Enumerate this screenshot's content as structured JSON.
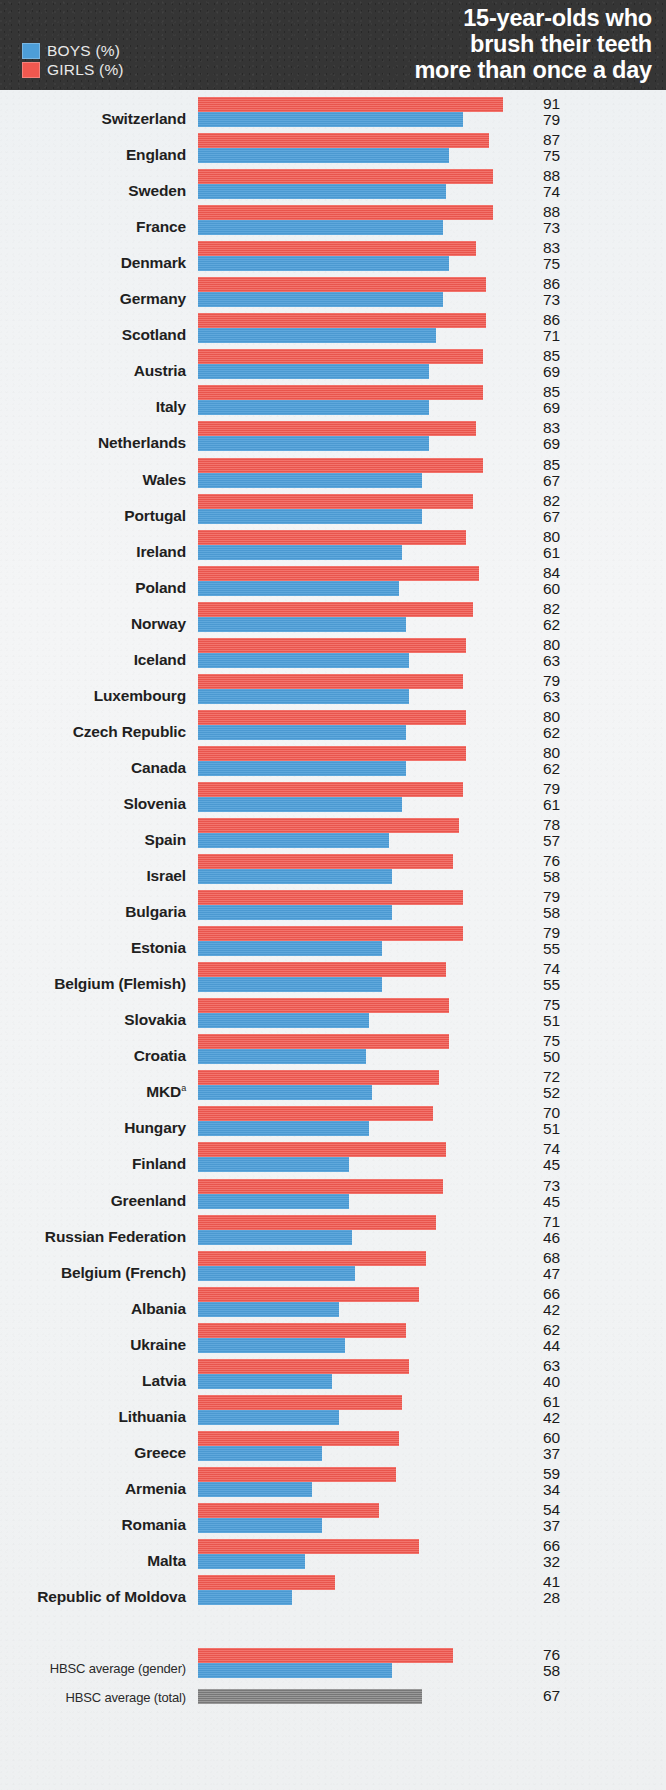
{
  "header": {
    "title_lines": [
      "15-year-olds who",
      "brush their teeth",
      "more than once a day"
    ],
    "legend": [
      {
        "label": "BOYS (%)",
        "color": "#4d9ed8",
        "key": "boys"
      },
      {
        "label": "GIRLS (%)",
        "color": "#f0584f",
        "key": "girls"
      }
    ],
    "background_color": "#353535"
  },
  "chart_data": {
    "type": "bar",
    "orientation": "horizontal",
    "title": "15-year-olds who brush their teeth more than once a day",
    "xlabel": "",
    "ylabel": "",
    "xlim": [
      0,
      100
    ],
    "grid": false,
    "legend_position": "top-left",
    "sorted_by": "boys descending",
    "categories": [
      "Switzerland",
      "England",
      "Sweden",
      "France",
      "Denmark",
      "Germany",
      "Scotland",
      "Austria",
      "Italy",
      "Netherlands",
      "Wales",
      "Portugal",
      "Ireland",
      "Poland",
      "Norway",
      "Iceland",
      "Luxembourg",
      "Czech Republic",
      "Canada",
      "Slovenia",
      "Spain",
      "Israel",
      "Bulgaria",
      "Estonia",
      "Belgium (Flemish)",
      "Slovakia",
      "Croatia",
      "MKD",
      "Hungary",
      "Finland",
      "Greenland",
      "Russian Federation",
      "Belgium (French)",
      "Albania",
      "Ukraine",
      "Latvia",
      "Lithuania",
      "Greece",
      "Armenia",
      "Romania",
      "Malta",
      "Republic of Moldova"
    ],
    "series": [
      {
        "name": "GIRLS (%)",
        "color": "#f0584f",
        "values": [
          91,
          87,
          88,
          88,
          83,
          86,
          86,
          85,
          85,
          83,
          85,
          82,
          80,
          84,
          82,
          80,
          79,
          80,
          80,
          79,
          78,
          76,
          79,
          79,
          74,
          75,
          75,
          72,
          70,
          74,
          73,
          71,
          68,
          66,
          62,
          63,
          61,
          60,
          59,
          54,
          66,
          41
        ]
      },
      {
        "name": "BOYS (%)",
        "color": "#4d9ed8",
        "values": [
          79,
          75,
          74,
          73,
          75,
          73,
          71,
          69,
          69,
          69,
          67,
          67,
          61,
          60,
          62,
          63,
          63,
          62,
          62,
          61,
          57,
          58,
          58,
          55,
          55,
          51,
          50,
          52,
          51,
          45,
          45,
          46,
          47,
          42,
          44,
          40,
          42,
          37,
          34,
          37,
          32,
          28
        ]
      }
    ],
    "averages": [
      {
        "label": "HBSC average (gender)",
        "girls": 76,
        "boys": 58
      },
      {
        "label": "HBSC average (total)",
        "total": 67,
        "color": "#7d7d7d"
      }
    ],
    "footnotes": [
      {
        "marker": "a",
        "applies_to": "MKD"
      }
    ]
  },
  "rows": [
    {
      "label": "Switzerland",
      "sup": "",
      "girls": 91,
      "boys": 79
    },
    {
      "label": "England",
      "sup": "",
      "girls": 87,
      "boys": 75
    },
    {
      "label": "Sweden",
      "sup": "",
      "girls": 88,
      "boys": 74
    },
    {
      "label": "France",
      "sup": "",
      "girls": 88,
      "boys": 73
    },
    {
      "label": "Denmark",
      "sup": "",
      "girls": 83,
      "boys": 75
    },
    {
      "label": "Germany",
      "sup": "",
      "girls": 86,
      "boys": 73
    },
    {
      "label": "Scotland",
      "sup": "",
      "girls": 86,
      "boys": 71
    },
    {
      "label": "Austria",
      "sup": "",
      "girls": 85,
      "boys": 69
    },
    {
      "label": "Italy",
      "sup": "",
      "girls": 85,
      "boys": 69
    },
    {
      "label": "Netherlands",
      "sup": "",
      "girls": 83,
      "boys": 69
    },
    {
      "label": "Wales",
      "sup": "",
      "girls": 85,
      "boys": 67
    },
    {
      "label": "Portugal",
      "sup": "",
      "girls": 82,
      "boys": 67
    },
    {
      "label": "Ireland",
      "sup": "",
      "girls": 80,
      "boys": 61
    },
    {
      "label": "Poland",
      "sup": "",
      "girls": 84,
      "boys": 60
    },
    {
      "label": "Norway",
      "sup": "",
      "girls": 82,
      "boys": 62
    },
    {
      "label": "Iceland",
      "sup": "",
      "girls": 80,
      "boys": 63
    },
    {
      "label": "Luxembourg",
      "sup": "",
      "girls": 79,
      "boys": 63
    },
    {
      "label": "Czech Republic",
      "sup": "",
      "girls": 80,
      "boys": 62
    },
    {
      "label": "Canada",
      "sup": "",
      "girls": 80,
      "boys": 62
    },
    {
      "label": "Slovenia",
      "sup": "",
      "girls": 79,
      "boys": 61
    },
    {
      "label": "Spain",
      "sup": "",
      "girls": 78,
      "boys": 57
    },
    {
      "label": "Israel",
      "sup": "",
      "girls": 76,
      "boys": 58
    },
    {
      "label": "Bulgaria",
      "sup": "",
      "girls": 79,
      "boys": 58
    },
    {
      "label": "Estonia",
      "sup": "",
      "girls": 79,
      "boys": 55
    },
    {
      "label": "Belgium (Flemish)",
      "sup": "",
      "girls": 74,
      "boys": 55
    },
    {
      "label": "Slovakia",
      "sup": "",
      "girls": 75,
      "boys": 51
    },
    {
      "label": "Croatia",
      "sup": "",
      "girls": 75,
      "boys": 50
    },
    {
      "label": "MKD",
      "sup": "a",
      "girls": 72,
      "boys": 52
    },
    {
      "label": "Hungary",
      "sup": "",
      "girls": 70,
      "boys": 51
    },
    {
      "label": "Finland",
      "sup": "",
      "girls": 74,
      "boys": 45
    },
    {
      "label": "Greenland",
      "sup": "",
      "girls": 73,
      "boys": 45
    },
    {
      "label": "Russian Federation",
      "sup": "",
      "girls": 71,
      "boys": 46
    },
    {
      "label": "Belgium (French)",
      "sup": "",
      "girls": 68,
      "boys": 47
    },
    {
      "label": "Albania",
      "sup": "",
      "girls": 66,
      "boys": 42
    },
    {
      "label": "Ukraine",
      "sup": "",
      "girls": 62,
      "boys": 44
    },
    {
      "label": "Latvia",
      "sup": "",
      "girls": 63,
      "boys": 40
    },
    {
      "label": "Lithuania",
      "sup": "",
      "girls": 61,
      "boys": 42
    },
    {
      "label": "Greece",
      "sup": "",
      "girls": 60,
      "boys": 37
    },
    {
      "label": "Armenia",
      "sup": "",
      "girls": 59,
      "boys": 34
    },
    {
      "label": "Romania",
      "sup": "",
      "girls": 54,
      "boys": 37
    },
    {
      "label": "Malta",
      "sup": "",
      "girls": 66,
      "boys": 32
    },
    {
      "label": "Republic of Moldova",
      "sup": "",
      "girls": 41,
      "boys": 28
    }
  ],
  "averages": [
    {
      "label": "HBSC average (gender)",
      "girls": 76,
      "boys": 58,
      "total": null
    },
    {
      "label": "HBSC average (total)",
      "girls": null,
      "boys": null,
      "total": 67
    }
  ]
}
